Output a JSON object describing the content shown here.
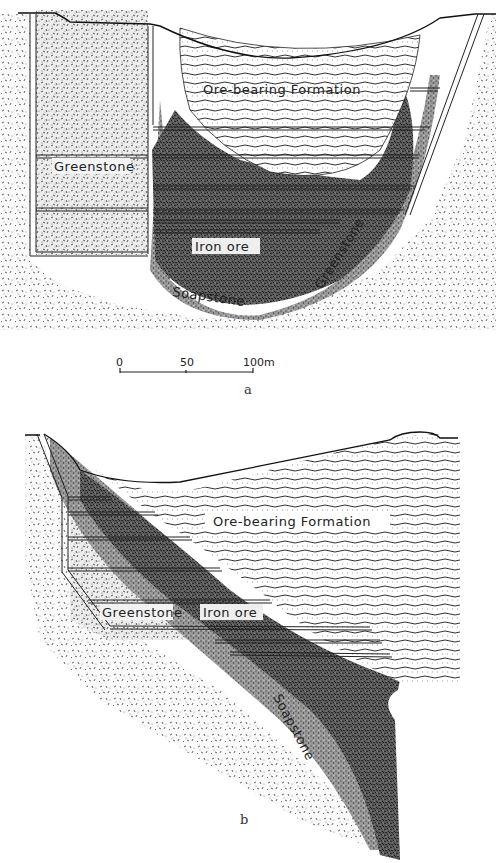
{
  "figure": {
    "type": "geological cross-sections",
    "panels": [
      {
        "id": "a",
        "caption": "a",
        "labels": {
          "ore_formation": "Ore-bearing Formation",
          "greenstone_left": "Greenstone",
          "iron_ore": "Iron ore",
          "soapstone": "Soapstone",
          "greenstone_right": "Greenstone"
        },
        "scale_bar": {
          "ticks": [
            "0",
            "50",
            "100m"
          ],
          "length_m": 100
        }
      },
      {
        "id": "b",
        "caption": "b",
        "labels": {
          "ore_formation": "Ore-bearing Formation",
          "greenstone": "Greenstone",
          "iron_ore": "Iron ore",
          "soapstone": "Soapstone"
        }
      }
    ],
    "colors": {
      "ink": "#222222",
      "ore_dark": "#3a3a3a",
      "paper": "#ffffff"
    }
  }
}
